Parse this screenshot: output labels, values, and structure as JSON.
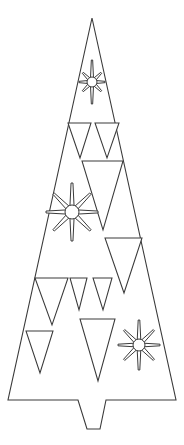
{
  "artwork": {
    "title": "Christmas Tree Line Art",
    "subject": "christmas-tree",
    "style": "black-and-white line drawing",
    "canvas": {
      "width": 184,
      "height": 445
    },
    "background_color": "#ffffff",
    "stroke_color": "#3a3a3a",
    "fill_color": "#ffffff"
  },
  "tree": {
    "name": "christmas-tree-outline",
    "description": "Tall narrow isosceles triangle with a notched trunk cut into the base",
    "apex": {
      "x": 92,
      "y": 18
    },
    "base_left": {
      "x": 8,
      "y": 400
    },
    "base_right": {
      "x": 176,
      "y": 400
    },
    "trunk": {
      "name": "trunk-notch",
      "top_left": {
        "x": 78,
        "y": 400
      },
      "top_right": {
        "x": 106,
        "y": 400
      },
      "bottom_left": {
        "x": 87,
        "y": 429
      },
      "bottom_right": {
        "x": 100,
        "y": 429
      }
    },
    "outline_points": "92,18 176,400 106,400 100,429 87,429 78,400 8,400"
  },
  "ornaments": {
    "triangles": [
      {
        "name": "triangle-upper-left-small",
        "points": "68,123 91,123 80,158",
        "size": "small"
      },
      {
        "name": "triangle-upper-right-small",
        "points": "95,123 119,123 107,158",
        "size": "small"
      },
      {
        "name": "triangle-upper-center-large",
        "points": "82,161 123,161 103,230",
        "size": "large"
      },
      {
        "name": "triangle-mid-right",
        "points": "105,238 142,238 124,293",
        "size": "medium"
      },
      {
        "name": "triangle-lower-left-medium",
        "points": "35,278 68,278 52,325",
        "size": "medium"
      },
      {
        "name": "triangle-lower-center-small-a",
        "points": "70,278 87,278 79,310",
        "size": "small"
      },
      {
        "name": "triangle-lower-center-small-b",
        "points": "93,278 112,278 103,310",
        "size": "small"
      },
      {
        "name": "triangle-bottom-left",
        "points": "26,331 53,331 40,373",
        "size": "medium"
      },
      {
        "name": "triangle-bottom-center-large",
        "points": "80,319 115,319 98,381",
        "size": "large"
      }
    ],
    "snowflakes": [
      {
        "name": "snowflake-top",
        "cx": 92,
        "cy": 82,
        "radius": 13,
        "vertical_radius": 22,
        "hub_radius": 5,
        "ray_count": 8
      },
      {
        "name": "snowflake-middle-left",
        "cx": 72,
        "cy": 212,
        "radius": 26,
        "vertical_radius": 29,
        "hub_radius": 7,
        "ray_count": 8
      },
      {
        "name": "snowflake-bottom-right",
        "cx": 139,
        "cy": 345,
        "radius": 21,
        "vertical_radius": 25,
        "hub_radius": 6,
        "ray_count": 8
      }
    ]
  }
}
